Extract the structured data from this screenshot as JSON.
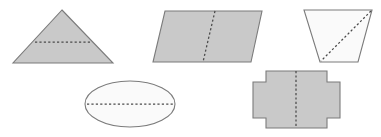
{
  "figure": {
    "title": "Shapes with lines of symmetry",
    "background_color": "#ffffff",
    "outline_color": "#7b7b7b",
    "symmetry_line_color": "#4a4a4a",
    "fill_gray": "#c9c9c9",
    "fill_light": "#fafafa",
    "canvas": {
      "width": 381,
      "height": 137
    }
  },
  "shapes": [
    {
      "id": "triangle",
      "name": "Isosceles triangle",
      "row": 1,
      "position": "top-left",
      "fill": "#c9c9c9",
      "points": "62,10 113,63 13,63",
      "symmetry_line": {
        "type": "horizontal",
        "x1": 35,
        "y1": 42,
        "x2": 90,
        "y2": 42
      }
    },
    {
      "id": "parallelogram",
      "name": "Parallelogram",
      "row": 1,
      "position": "top-center",
      "fill": "#c9c9c9",
      "points": "165,11 262,11 251,62 153,62",
      "symmetry_line": {
        "type": "vertical-slanted",
        "x1": 215,
        "y1": 11,
        "x2": 203,
        "y2": 62
      }
    },
    {
      "id": "trapezoid",
      "name": "Trapezoid",
      "row": 1,
      "position": "top-right",
      "fill": "#fafafa",
      "points": "304,10 372,10 358,62 320,62",
      "symmetry_line": {
        "type": "diagonal",
        "x1": 371,
        "y1": 11,
        "x2": 321,
        "y2": 61
      }
    },
    {
      "id": "ellipse",
      "name": "Ellipse",
      "row": 2,
      "position": "bottom-left",
      "fill": "#fafafa",
      "cx": 130,
      "cy": 104,
      "rx": 45,
      "ry": 23,
      "symmetry_line": {
        "type": "horizontal",
        "x1": 87,
        "y1": 104,
        "x2": 173,
        "y2": 104
      }
    },
    {
      "id": "cross",
      "name": "Cross / plus-shaped polygon",
      "row": 2,
      "position": "bottom-right",
      "fill": "#c9c9c9",
      "points": "266,71 327,71 327,82 340,82 340,118 327,118 327,128 266,128 266,118 253,118 253,82 266,82",
      "symmetry_line": {
        "type": "vertical",
        "x1": 296,
        "y1": 71,
        "x2": 296,
        "y2": 128
      }
    }
  ]
}
